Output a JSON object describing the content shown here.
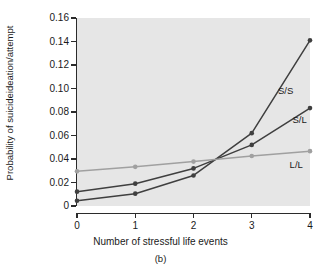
{
  "figure": {
    "panel_caption": "(b)",
    "background_color": "#ffffff",
    "plot_background_color": "#e6e6e6"
  },
  "axes": {
    "y_title_line1": "Probability of suicide",
    "y_title_line2": "ideation/attempt",
    "x_title": "Number of stressful life events",
    "y_ticks": [
      "0",
      "0.02",
      "0.04",
      "0.06",
      "0.08",
      "0.10",
      "0.12",
      "0.14",
      "0.16"
    ],
    "x_ticks": [
      "0",
      "1",
      "2",
      "3",
      "4"
    ]
  },
  "chart_data": {
    "type": "line",
    "title": "",
    "subtitle": "",
    "xlabel": "Number of stressful life events",
    "ylabel": "Probability of suicide ideation/attempt",
    "x": [
      0,
      1,
      2,
      3,
      4
    ],
    "xlim": [
      0,
      4
    ],
    "ylim": [
      0,
      0.16
    ],
    "ytick_values": [
      0,
      0.02,
      0.04,
      0.06,
      0.08,
      0.1,
      0.12,
      0.14,
      0.16
    ],
    "xtick_values": [
      0,
      1,
      2,
      3,
      4
    ],
    "grid": false,
    "legend_position": "inline-annotations",
    "annotations": [
      {
        "text": "S/S",
        "x": 3.45,
        "y": 0.098
      },
      {
        "text": "S/L",
        "x": 3.7,
        "y": 0.073
      },
      {
        "text": "L/L",
        "x": 3.65,
        "y": 0.035
      }
    ],
    "series": [
      {
        "name": "S/S",
        "color": "#3f3f3f",
        "marker": "circle",
        "values": [
          0.0045,
          0.0105,
          0.026,
          0.062,
          0.141
        ]
      },
      {
        "name": "S/L",
        "color": "#3f3f3f",
        "marker": "circle",
        "values": [
          0.0122,
          0.019,
          0.032,
          0.052,
          0.0833
        ]
      },
      {
        "name": "L/L",
        "color": "#a0a0a0",
        "marker": "circle",
        "values": [
          0.0295,
          0.0333,
          0.0378,
          0.0425,
          0.0467
        ]
      }
    ]
  }
}
